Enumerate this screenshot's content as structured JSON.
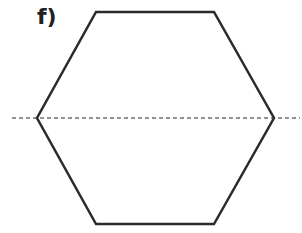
{
  "figure": {
    "label": "f)",
    "shape": "regular hexagon",
    "line_color": "#2b2b2b",
    "symmetry_line": {
      "style": "dashed",
      "orientation": "horizontal",
      "description": "line of symmetry through left and right vertices"
    }
  }
}
